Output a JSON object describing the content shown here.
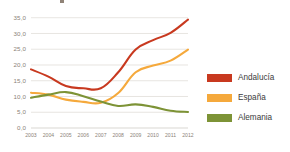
{
  "figure": {
    "name": "unemployment-rate-line-chart",
    "background": "#ffffff",
    "cropped_title_fragment": ""
  },
  "chart_data": {
    "type": "line",
    "title": "",
    "subtitle": "",
    "xlabel": "",
    "ylabel": "",
    "x": [
      2003,
      2004,
      2005,
      2006,
      2007,
      2008,
      2009,
      2010,
      2011,
      2012
    ],
    "categories": [
      "2003",
      "2004",
      "2005",
      "2006",
      "2007",
      "2008",
      "2009",
      "2010",
      "2011",
      "2012"
    ],
    "series": [
      {
        "name": "Andalucía",
        "color": "#c8391f",
        "values": [
          18.6,
          16.3,
          13.3,
          12.6,
          12.6,
          17.7,
          24.9,
          27.9,
          30.2,
          34.4
        ]
      },
      {
        "name": "España",
        "color": "#f5a93c",
        "values": [
          11.2,
          10.6,
          9.0,
          8.3,
          8.0,
          11.1,
          17.7,
          19.8,
          21.4,
          24.9
        ]
      },
      {
        "name": "Alemania",
        "color": "#7d9336",
        "values": [
          9.6,
          10.6,
          11.4,
          10.1,
          8.4,
          7.0,
          7.5,
          6.7,
          5.5,
          5.1
        ]
      }
    ],
    "ylim": [
      0.0,
      36.5
    ],
    "y_ticks": [
      0.0,
      5.0,
      10.0,
      15.0,
      20.0,
      25.0,
      30.0,
      35.0
    ],
    "y_tick_labels": [
      "0,0",
      "5,0",
      "10,0",
      "15,0",
      "20,0",
      "25,0",
      "30,0",
      "35,0"
    ],
    "grid": true,
    "grid_axis": "y",
    "legend_position": "right",
    "legend": [
      {
        "label": "Andalucía",
        "color": "#c8391f"
      },
      {
        "label": "España",
        "color": "#f5a93c"
      },
      {
        "label": "Alemania",
        "color": "#7d9336"
      }
    ]
  }
}
